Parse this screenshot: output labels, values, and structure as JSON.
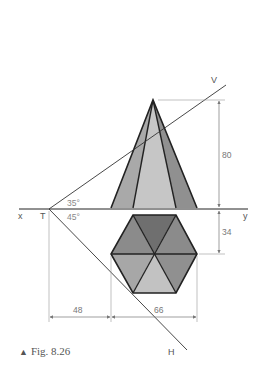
{
  "figure": {
    "caption_marker": "▲",
    "caption": "Fig. 8.26",
    "labels": {
      "x": "x",
      "y": "y",
      "T": "T",
      "V": "V",
      "H": "H"
    },
    "angles": {
      "vt_angle": "35°",
      "ht_angle": "45°"
    },
    "dimensions": {
      "height": "80",
      "offset_below_xy": "34",
      "distance_from_T": "48",
      "hexagon_width": "66"
    },
    "colors": {
      "line": "#222222",
      "thin_line": "#555555",
      "dim_line": "#888888",
      "pyramid_left_face": "#a9a9a9",
      "pyramid_middle_face": "#c6c6c6",
      "pyramid_right_face": "#909090",
      "hex_top": "#6f6f6f",
      "hex_upper_left": "#8b8b8b",
      "hex_upper_right": "#8b8b8b",
      "hex_lower_left": "#a7a7a7",
      "hex_bottom": "#c2c2c2",
      "hex_lower_right": "#909090"
    }
  }
}
